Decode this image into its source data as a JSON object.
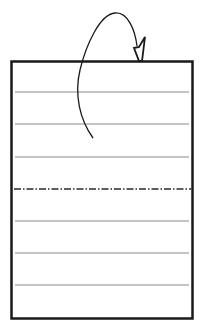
{
  "diagram": {
    "title": "",
    "paper": {
      "ruled_lines": 6,
      "fold_lines": 1
    },
    "fold_line": {
      "style": "dash-dot",
      "meaning": "fold line"
    },
    "arrow": {
      "type": "curved-fold-arrow",
      "meaning": "fold behind"
    },
    "colors": {
      "stroke": "#1a1a1a",
      "ruled_line": "#8a8a8a",
      "background": "#ffffff"
    }
  }
}
